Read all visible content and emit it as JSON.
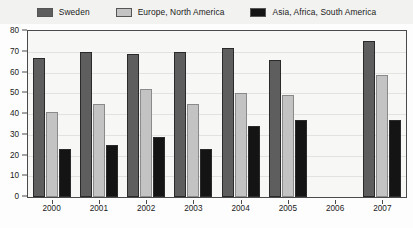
{
  "legend": {
    "entries": [
      {
        "label": "Sweden",
        "color": "#5e5e5e"
      },
      {
        "label": "Europe, North America",
        "color": "#c3c3c3"
      },
      {
        "label": "Asia, Africa, South America",
        "color": "#141414"
      }
    ]
  },
  "chart_data": {
    "type": "bar",
    "title": "",
    "xlabel": "",
    "ylabel": "",
    "categories": [
      "2000",
      "2001",
      "2002",
      "2003",
      "2004",
      "2005",
      "2006",
      "2007"
    ],
    "series": [
      {
        "name": "Sweden",
        "color": "#5e5e5e",
        "values": [
          67,
          70,
          69,
          70,
          72,
          66,
          null,
          75
        ]
      },
      {
        "name": "Europe, North America",
        "color": "#c3c3c3",
        "values": [
          41,
          45,
          52,
          45,
          50,
          49,
          null,
          59
        ]
      },
      {
        "name": "Asia, Africa, South America",
        "color": "#141414",
        "values": [
          23,
          25,
          29,
          23,
          34,
          37,
          null,
          37
        ]
      }
    ],
    "ylim": [
      0,
      80
    ],
    "yticks": [
      0,
      10,
      20,
      30,
      40,
      50,
      60,
      70,
      80
    ],
    "ytick_labels": [
      "0",
      "10",
      "20",
      "30",
      "40",
      "50",
      "60",
      "70",
      "80"
    ],
    "grid": true,
    "legend_position": "top"
  }
}
